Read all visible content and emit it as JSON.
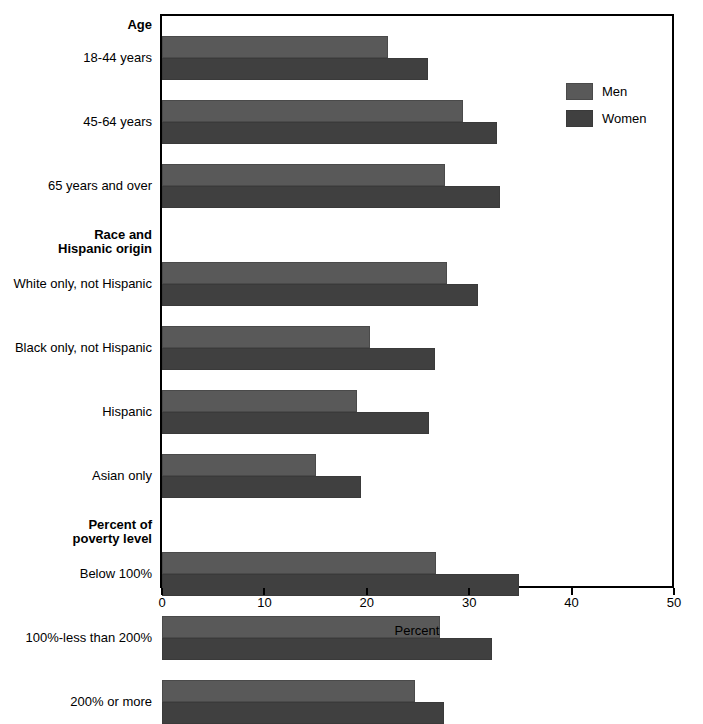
{
  "chart_data": {
    "type": "bar",
    "orientation": "horizontal",
    "title": "",
    "xlabel": "Percent",
    "ylabel": "",
    "xlim": [
      0,
      50
    ],
    "xticks": [
      0,
      10,
      20,
      30,
      40,
      50
    ],
    "xticklabels": [
      "0",
      "10",
      "20",
      "30",
      "40",
      "50"
    ],
    "grid": false,
    "legend_position": "upper right",
    "legend": [
      "Men",
      "Women"
    ],
    "section_headings": [
      "Age",
      "Race and\nHispanic origin",
      "Percent of\npoverty level"
    ],
    "categories": [
      "18-44 years",
      "45-64 years",
      "65 years and over",
      "White only, not Hispanic",
      "Black only, not Hispanic",
      "Hispanic",
      "Asian only",
      "Below 100%",
      "100%-less than 200%",
      "200% or more"
    ],
    "series": [
      {
        "name": "Men",
        "color": "#595959",
        "values": [
          22.1,
          29.4,
          27.6,
          27.8,
          20.3,
          19.0,
          15.0,
          26.8,
          27.1,
          24.7
        ]
      },
      {
        "name": "Women",
        "color": "#404040",
        "values": [
          26.0,
          32.7,
          33.0,
          30.9,
          26.7,
          26.1,
          19.4,
          34.9,
          32.2,
          27.5
        ]
      }
    ]
  },
  "axis": {
    "x_title": "Percent",
    "ticks": [
      "0",
      "10",
      "20",
      "30",
      "40",
      "50"
    ]
  },
  "legend": {
    "items": [
      {
        "label": "Men",
        "color": "#595959"
      },
      {
        "label": "Women",
        "color": "#404040"
      }
    ]
  },
  "groups": [
    {
      "heading": "Age",
      "heading_lines": [
        "Age"
      ],
      "rows": [
        {
          "label": "18-44 years",
          "men": 22.1,
          "women": 26.0
        },
        {
          "label": "45-64 years",
          "men": 29.4,
          "women": 32.7
        },
        {
          "label": "65 years and over",
          "men": 27.6,
          "women": 33.0
        }
      ]
    },
    {
      "heading": "Race and Hispanic origin",
      "heading_lines": [
        "Race and",
        "Hispanic origin"
      ],
      "rows": [
        {
          "label": "White only, not Hispanic",
          "men": 27.8,
          "women": 30.9
        },
        {
          "label": "Black only, not Hispanic",
          "men": 20.3,
          "women": 26.7
        },
        {
          "label": "Hispanic",
          "men": 19.0,
          "women": 26.1
        },
        {
          "label": "Asian only",
          "men": 15.0,
          "women": 19.4
        }
      ]
    },
    {
      "heading": "Percent of poverty level",
      "heading_lines": [
        "Percent of",
        "poverty level"
      ],
      "rows": [
        {
          "label": "Below 100%",
          "men": 26.8,
          "women": 34.9
        },
        {
          "label": "100%-less than 200%",
          "men": 27.1,
          "women": 32.2
        },
        {
          "label": "200% or more",
          "men": 24.7,
          "women": 27.5
        }
      ]
    }
  ]
}
